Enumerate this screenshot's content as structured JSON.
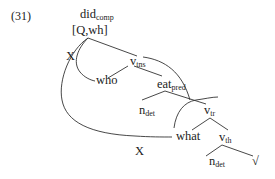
{
  "example_number": "(31)",
  "nodes": {
    "root": {
      "base": "did",
      "sub": "comp",
      "features": "[Q,wh]"
    },
    "v_tns": {
      "base": "v",
      "sub": "tns"
    },
    "who": {
      "base": "who"
    },
    "eat_pred": {
      "base": "eat",
      "sub": "pred"
    },
    "n_det_1": {
      "base": "n",
      "sub": "det"
    },
    "v_tr": {
      "base": "v",
      "sub": "tr"
    },
    "what": {
      "base": "what"
    },
    "v_th": {
      "base": "v",
      "sub": "th"
    },
    "n_det_2": {
      "base": "n",
      "sub": "det"
    },
    "root_sym": {
      "base": "√"
    }
  },
  "arc_labels": {
    "x_upper": "X",
    "x_lower": "X"
  },
  "colors": {
    "lines": "#333333",
    "text": "#222222"
  }
}
